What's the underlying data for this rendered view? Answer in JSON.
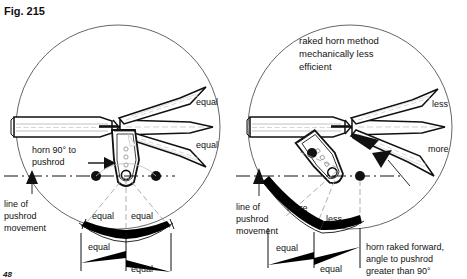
{
  "figure": {
    "number": "Fig. 215",
    "page_number": "48"
  },
  "left_panel": {
    "name": "ninety-degree-horn-method",
    "horn_label": "horn 90° to\npushrod",
    "horn_label_line1": "horn 90° to",
    "horn_label_line2": "pushrod",
    "pushrod_line_label_line1": "line of",
    "pushrod_line_label_line2": "pushrod",
    "pushrod_line_label_line3": "movement",
    "surface_travel_up": "equal",
    "surface_travel_down": "equal",
    "arc_label_left": "equal",
    "arc_label_right": "equal",
    "wedge_label_upper": "equal",
    "wedge_label_lower": "equal"
  },
  "right_panel": {
    "name": "raked-horn-method",
    "title_line1": "raked horn method",
    "title_line2": "mechanically less",
    "title_line3": "efficient",
    "pushrod_line_label_line1": "line of",
    "pushrod_line_label_line2": "pushrod",
    "pushrod_line_label_line3": "movement",
    "surface_travel_up": "less",
    "surface_travel_down": "more",
    "arc_label_left": "more",
    "arc_label_right": "less",
    "wedge_label_upper": "equal",
    "wedge_label_lower": "equal",
    "caption_line1": "horn raked forward,",
    "caption_line2": "angle to pushrod",
    "caption_line3": "greater than 90°"
  },
  "colors": {
    "ink": "#111111",
    "paper": "#ffffff",
    "hairline": "#555555",
    "wedge_fill": "#000000"
  }
}
